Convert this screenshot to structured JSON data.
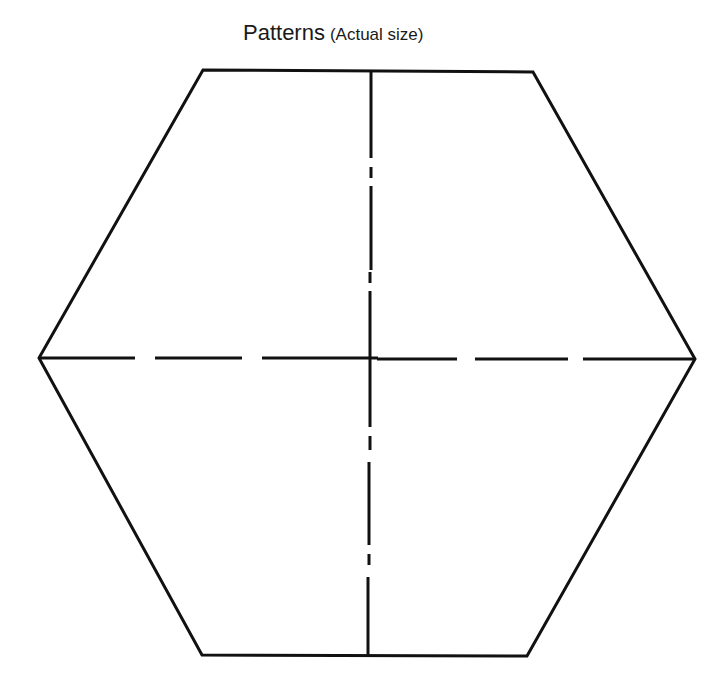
{
  "title": {
    "main": "Patterns",
    "sub": "(Actual size)"
  },
  "colors": {
    "background": "#ffffff",
    "stroke": "#111111"
  },
  "hexagon": {
    "vertices": [
      [
        203,
        70
      ],
      [
        533,
        72
      ],
      [
        695,
        359
      ],
      [
        527,
        656
      ],
      [
        202,
        655
      ],
      [
        39,
        358
      ]
    ]
  },
  "axes": {
    "vertical": {
      "top": [
        371,
        70
      ],
      "bottom": [
        368,
        655
      ],
      "style": "dash-dot"
    },
    "horizontal": {
      "left": [
        39,
        358
      ],
      "right": [
        695,
        359
      ],
      "style": "dashed"
    }
  }
}
